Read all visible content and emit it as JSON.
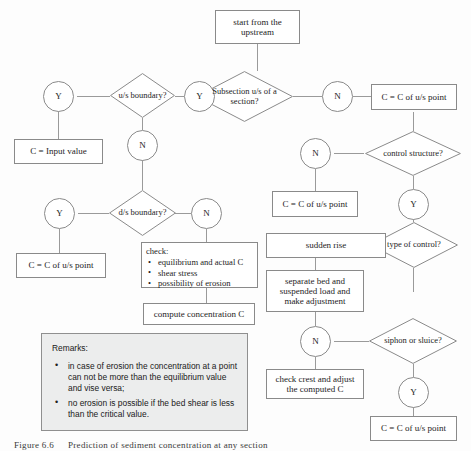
{
  "figure": {
    "caption_number": "Figure 6.6",
    "caption_text": "Prediction of sediment concentration at any section"
  },
  "nodes": {
    "start": "start from the upstream",
    "us_boundary": "u/s boundary?",
    "us_boundary_yes": "Y",
    "us_boundary_no": "N",
    "input_value": "C = Input value",
    "subsection": "Subsection u/s of a section?",
    "subsection_yes": "Y",
    "subsection_no": "N",
    "c_us_point_top_right": "C = C of u/s point",
    "control_structure": "control structure?",
    "control_structure_no": "N",
    "control_structure_yes": "Y",
    "c_us_point_mid_right": "C = C of u/s point",
    "ds_boundary": "d/s boundary?",
    "ds_boundary_yes": "Y",
    "ds_boundary_no": "N",
    "c_us_point_left": "C = C of u/s point",
    "check_title": "check:",
    "check_items": [
      "equilibrium and actual C",
      "shear stress",
      "possibility of erosion"
    ],
    "compute_concentration": "compute concentration C",
    "type_of_control": "type of control?",
    "sudden_rise": "sudden rise",
    "separate_bed": "separate bed and suspended load and make adjustment",
    "siphon_or_sluice": "siphon or sluice?",
    "siphon_no": "N",
    "siphon_yes": "Y",
    "check_crest": "check crest and adjust the computed C",
    "c_us_point_bottom_right": "C = C of u/s point"
  },
  "remarks": {
    "title": "Remarks:",
    "items": [
      "in case of erosion the concentration at a point can not be more than the equilibrium value and vise versa;",
      "no erosion is possible if the bed shear is less than the critical value."
    ]
  },
  "colors": {
    "stroke": "#8a8a8a",
    "line": "#9a9a9a",
    "remarks_bg": "#eceded",
    "text": "#1d1d1d"
  }
}
